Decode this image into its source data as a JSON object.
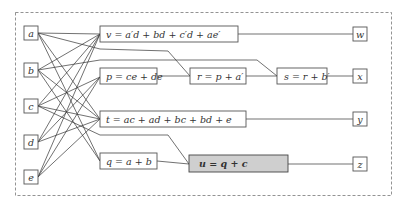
{
  "diagram": {
    "inputs": [
      {
        "id": "a",
        "label": "a"
      },
      {
        "id": "b",
        "label": "b"
      },
      {
        "id": "c",
        "label": "c"
      },
      {
        "id": "d",
        "label": "d"
      },
      {
        "id": "e",
        "label": "e"
      }
    ],
    "gates": [
      {
        "id": "v",
        "label": "v = a′d + bd + c′d + ae′",
        "highlighted": false
      },
      {
        "id": "p",
        "label": "p = ce + de",
        "highlighted": false
      },
      {
        "id": "r",
        "label": "r = p + a′",
        "highlighted": false
      },
      {
        "id": "s",
        "label": "s = r + b′",
        "highlighted": false
      },
      {
        "id": "t",
        "label": "t = ac + ad + bc + bd + e",
        "highlighted": false
      },
      {
        "id": "q",
        "label": "q = a + b",
        "highlighted": false
      },
      {
        "id": "u",
        "label": "u = q + c",
        "highlighted": true
      }
    ],
    "outputs": [
      {
        "id": "w",
        "label": "w"
      },
      {
        "id": "x",
        "label": "x"
      },
      {
        "id": "y",
        "label": "y"
      },
      {
        "id": "z",
        "label": "z"
      }
    ],
    "colors": {
      "highlight_fill": "#cfcfcf",
      "stroke": "#333333",
      "frame": "#777777"
    }
  }
}
